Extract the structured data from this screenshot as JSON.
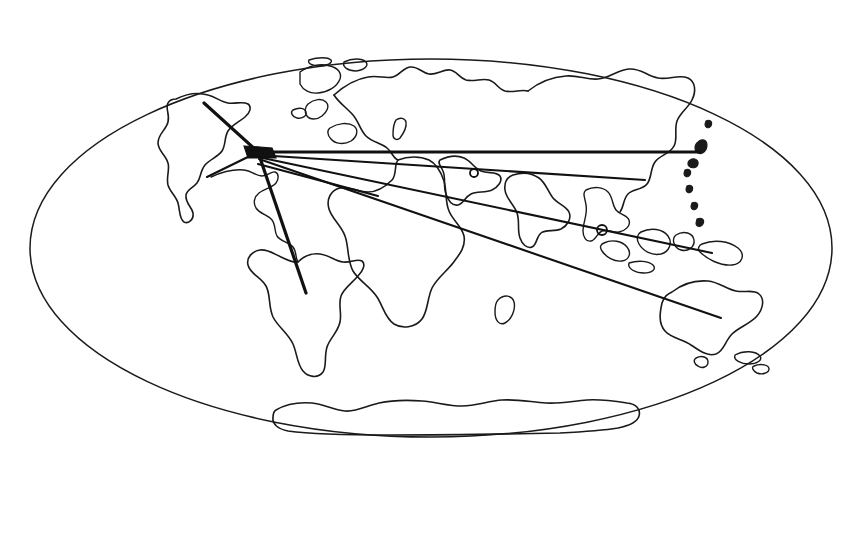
{
  "figure": {
    "projection": "oval (Mollweide-style) world projection",
    "style": "hand-drawn black ink line art on white background",
    "background_color": "#ffffff",
    "ink_color": "#1a1a1a",
    "route_color": "#111111",
    "canvas": {
      "width": 868,
      "height": 554
    }
  },
  "globe": {
    "name": "world-outline-ellipse",
    "center_x": 431,
    "center_y": 248,
    "radius_x": 401,
    "radius_y": 189,
    "top_y": 59,
    "bottom_y": 437,
    "left_x": 30,
    "right_x": 832
  },
  "hub": {
    "label": "central-origin-hub",
    "x": 258,
    "y": 152,
    "description": "convergence point of all route lines, located over the North Atlantic near Western Europe"
  },
  "landmasses": [
    {
      "name": "north-america",
      "label": "North America"
    },
    {
      "name": "greenland",
      "label": "Greenland"
    },
    {
      "name": "south-america",
      "label": "South America"
    },
    {
      "name": "europe",
      "label": "Europe"
    },
    {
      "name": "africa",
      "label": "Africa"
    },
    {
      "name": "asia",
      "label": "Asia"
    },
    {
      "name": "india",
      "label": "India"
    },
    {
      "name": "southeast-asia-islands",
      "label": "Southeast Asian Archipelago"
    },
    {
      "name": "australia",
      "label": "Australia"
    },
    {
      "name": "new-zealand",
      "label": "New Zealand"
    },
    {
      "name": "madagascar",
      "label": "Madagascar"
    },
    {
      "name": "antarctica",
      "label": "Antarctica"
    },
    {
      "name": "japan",
      "label": "Japan"
    },
    {
      "name": "british-isles",
      "label": "British Isles"
    }
  ],
  "routes": [
    {
      "id": "route-northwest",
      "label": "Route to Northwest (North America)",
      "from_x": 258,
      "from_y": 152,
      "to_x": 204,
      "to_y": 103,
      "weight": "heavy"
    },
    {
      "id": "route-west",
      "label": "Route to West (West Africa / Atlantic)",
      "from_x": 258,
      "from_y": 152,
      "to_x": 207,
      "to_y": 177,
      "weight": "normal"
    },
    {
      "id": "route-south",
      "label": "Route to South (South America)",
      "from_x": 258,
      "from_y": 152,
      "to_x": 306,
      "to_y": 293,
      "weight": "heavy"
    },
    {
      "id": "route-east-far",
      "label": "Route to Far East (East Asia)",
      "from_x": 258,
      "from_y": 152,
      "to_x": 700,
      "to_y": 152,
      "weight": "heavy"
    },
    {
      "id": "route-east-upper",
      "label": "Route to East (Central Asia)",
      "from_x": 258,
      "from_y": 152,
      "to_x": 662,
      "to_y": 152,
      "weight": "normal"
    },
    {
      "id": "route-east-mid",
      "label": "Route to East (South Asia)",
      "from_x": 258,
      "from_y": 155,
      "to_x": 645,
      "to_y": 180,
      "weight": "normal"
    },
    {
      "id": "route-southeast-indonesia",
      "label": "Route to Southeast (Indonesian Archipelago)",
      "from_x": 258,
      "from_y": 157,
      "to_x": 712,
      "to_y": 253,
      "weight": "normal"
    },
    {
      "id": "route-southeast-australia",
      "label": "Route to Southeast (Australia)",
      "from_x": 259,
      "from_y": 159,
      "to_x": 721,
      "to_y": 318,
      "weight": "normal"
    },
    {
      "id": "route-short-west-africa",
      "label": "Short spur to West Africa coast",
      "from_x": 258,
      "from_y": 164,
      "to_x": 378,
      "to_y": 196,
      "weight": "normal"
    }
  ],
  "waypoints": [
    {
      "id": "waypoint-arabia",
      "label": "Waypoint near Arabia",
      "x": 474,
      "y": 173,
      "r": 4
    },
    {
      "id": "waypoint-indochina",
      "label": "Waypoint near Indochina",
      "x": 602,
      "y": 230,
      "r": 5
    }
  ]
}
